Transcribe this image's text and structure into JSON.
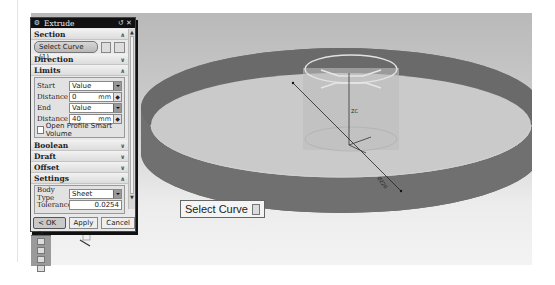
{
  "dialog": {
    "title": "Extrude",
    "title_icons": [
      "gear-icon",
      "reset-icon",
      "close-icon"
    ],
    "sections": {
      "section": {
        "label": "Section",
        "select_curve_label": "Select Curve (1)",
        "expanded": true
      },
      "direction": {
        "label": "Direction",
        "expanded": false
      },
      "limits": {
        "label": "Limits",
        "expanded": true,
        "start_label": "Start",
        "start_value": "Value",
        "start_distance_label": "Distance",
        "start_distance": "0",
        "start_unit": "mm",
        "end_label": "End",
        "end_value": "Value",
        "end_distance_label": "Distance",
        "end_distance": "40",
        "end_unit": "mm",
        "open_profile_label": "Open Profile Smart Volume",
        "open_profile_checked": false
      },
      "boolean": {
        "label": "Boolean",
        "expanded": false
      },
      "draft": {
        "label": "Draft",
        "expanded": false
      },
      "offset": {
        "label": "Offset",
        "expanded": false
      },
      "settings": {
        "label": "Settings",
        "expanded": true,
        "body_type_label": "Body Type",
        "body_type_value": "Sheet",
        "tolerance_label": "Tolerance",
        "tolerance_value": "0.0254"
      }
    },
    "buttons": {
      "ok": "< OK >",
      "apply": "Apply",
      "cancel": "Cancel"
    }
  },
  "viewport": {
    "tooltip": "Select Curve",
    "dimension_label": "Ø220",
    "height_label": "ZC",
    "colors": {
      "band": "#6f6f6f",
      "background_top": "#b9b9b9",
      "background_bottom": "#f3f3f3"
    }
  }
}
